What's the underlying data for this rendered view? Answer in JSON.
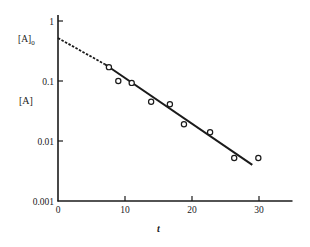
{
  "chart_data": {
    "type": "scatter",
    "title": "",
    "xlabel": "t",
    "ylabel": "[A]",
    "yscale": "log",
    "xlim": [
      0,
      35
    ],
    "ylim": [
      0.001,
      1
    ],
    "grid": false,
    "legend": null,
    "x_ticks": [
      0,
      10,
      20,
      30
    ],
    "x_tick_labels": [
      "0",
      "10",
      "20",
      "30"
    ],
    "y_ticks": [
      1,
      0.1,
      0.01,
      0.001
    ],
    "y_tick_labels": [
      "1",
      "0.1",
      "0.01",
      "0.001"
    ],
    "annotations": [
      {
        "text": "[A]",
        "subscript": "0",
        "at": {
          "t": 0,
          "A": 0.52
        },
        "note": "y-intercept of extrapolated fit line"
      }
    ],
    "series": [
      {
        "name": "data",
        "marker": "open-circle",
        "x": [
          7.6,
          9.0,
          11.0,
          13.9,
          16.7,
          18.8,
          22.7,
          26.3,
          29.9
        ],
        "y": [
          0.17,
          0.1,
          0.093,
          0.045,
          0.041,
          0.019,
          0.014,
          0.0052,
          0.0052
        ]
      },
      {
        "name": "fit-extrapolated",
        "style": "dashed",
        "x": [
          0,
          7.0
        ],
        "y": [
          0.52,
          0.19
        ]
      },
      {
        "name": "fit",
        "style": "solid",
        "x": [
          7.0,
          29.0
        ],
        "y": [
          0.19,
          0.004
        ]
      }
    ]
  },
  "labels": {
    "y_axis": "[A]",
    "x_axis": "t",
    "intercept_main": "[A]",
    "intercept_sub": "0",
    "yticks": [
      "1",
      "0.1",
      "0.01",
      "0.001"
    ],
    "xticks": [
      "0",
      "10",
      "20",
      "30"
    ]
  }
}
